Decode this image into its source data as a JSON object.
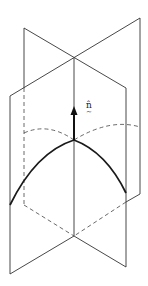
{
  "figure": {
    "labels": {
      "normal_vector": "n̂",
      "normal_vector_tilde": "~"
    },
    "colors": {
      "stroke": "#333333",
      "curve": "#1a1a1a",
      "arrow": "#111111",
      "background": "#ffffff"
    }
  }
}
